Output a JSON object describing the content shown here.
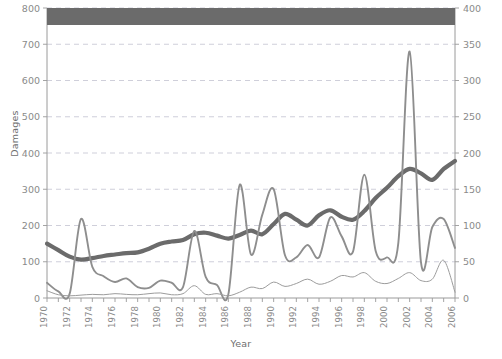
{
  "chart_data": {
    "type": "line",
    "title": "",
    "xlabel": "Year",
    "ylabel": "Damages",
    "y2label": "Total frequency (number of disasters)",
    "grid": true,
    "legend_position": "none",
    "redacted_banner": true,
    "banner_color": "#6b6b6b",
    "background": "#ffffff",
    "axis_color": "#9a9a9a",
    "grid_color": "#c9c9d6",
    "xlim": [
      1970,
      2006
    ],
    "ylim": [
      0,
      800
    ],
    "y2lim": [
      0,
      400
    ],
    "yticks": [
      0,
      100,
      200,
      300,
      400,
      500,
      600,
      700,
      800
    ],
    "y2ticks": [
      0,
      50,
      100,
      150,
      200,
      250,
      300,
      350,
      400
    ],
    "xticks": [
      1970,
      1972,
      1974,
      1976,
      1978,
      1980,
      1982,
      1984,
      1986,
      1988,
      1990,
      1992,
      1994,
      1996,
      1998,
      2000,
      2002,
      2004,
      2006
    ],
    "x": [
      1970,
      1971,
      1972,
      1973,
      1974,
      1975,
      1976,
      1977,
      1978,
      1979,
      1980,
      1981,
      1982,
      1983,
      1984,
      1985,
      1986,
      1987,
      1988,
      1989,
      1990,
      1991,
      1992,
      1993,
      1994,
      1995,
      1996,
      1997,
      1998,
      1999,
      2000,
      2001,
      2002,
      2003,
      2004,
      2005,
      2006
    ],
    "series": [
      {
        "name": "Total frequency (number of disasters)",
        "axis": "right",
        "color": "#6b6b6b",
        "width": 4.2,
        "values": [
          75,
          66,
          57,
          53,
          55,
          58,
          60,
          62,
          63,
          68,
          75,
          78,
          80,
          88,
          90,
          86,
          82,
          87,
          93,
          88,
          102,
          116,
          108,
          100,
          114,
          121,
          112,
          108,
          120,
          138,
          152,
          168,
          178,
          172,
          163,
          178,
          189
        ]
      },
      {
        "name": "Damages (mid series)",
        "axis": "left",
        "color": "#8e8e8e",
        "width": 1.9,
        "values": [
          42,
          18,
          12,
          218,
          86,
          60,
          44,
          54,
          30,
          28,
          48,
          42,
          30,
          185,
          58,
          36,
          10,
          312,
          120,
          230,
          300,
          118,
          112,
          146,
          112,
          222,
          170,
          128,
          340,
          130,
          112,
          152,
          680,
          98,
          196,
          218,
          138
        ]
      },
      {
        "name": "Damages (lower series)",
        "axis": "left",
        "color": "#9c9c9c",
        "width": 1.0,
        "values": [
          20,
          9,
          6,
          8,
          10,
          9,
          12,
          10,
          9,
          12,
          14,
          9,
          12,
          34,
          10,
          12,
          6,
          16,
          30,
          26,
          44,
          32,
          40,
          52,
          38,
          46,
          62,
          58,
          70,
          46,
          40,
          54,
          70,
          48,
          52,
          104,
          16
        ]
      }
    ]
  }
}
